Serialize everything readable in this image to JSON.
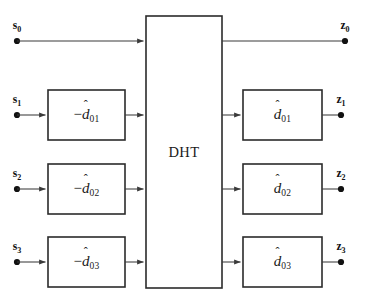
{
  "figure": {
    "background_color": "#ffffff",
    "line_color": "#3a3a3a",
    "box_border_color": "#2b2b2b",
    "text_color": "#1a1a1a",
    "width": 366,
    "height": 307
  },
  "center_block": {
    "label": "DHT",
    "x": 146,
    "y": 16,
    "width": 76,
    "height": 272
  },
  "inputs": [
    {
      "name": "s0",
      "letter": "s",
      "subscript": "0",
      "y": 41
    },
    {
      "name": "s1",
      "letter": "s",
      "subscript": "1",
      "y": 115
    },
    {
      "name": "s2",
      "letter": "s",
      "subscript": "2",
      "y": 189
    },
    {
      "name": "s3",
      "letter": "s",
      "subscript": "3",
      "y": 262
    }
  ],
  "outputs": [
    {
      "name": "z0",
      "letter": "z",
      "subscript": "0",
      "y": 41
    },
    {
      "name": "z1",
      "letter": "z",
      "subscript": "1",
      "y": 115
    },
    {
      "name": "z2",
      "letter": "z",
      "subscript": "2",
      "y": 189
    },
    {
      "name": "z3",
      "letter": "z",
      "subscript": "3",
      "y": 262
    }
  ],
  "left_blocks": [
    {
      "name": "neg-d01",
      "sign": "−",
      "base": "d",
      "hat": "ˆ",
      "subscript": "01",
      "y": 115
    },
    {
      "name": "neg-d02",
      "sign": "−",
      "base": "d",
      "hat": "ˆ",
      "subscript": "02",
      "y": 189
    },
    {
      "name": "neg-d03",
      "sign": "−",
      "base": "d",
      "hat": "ˆ",
      "subscript": "03",
      "y": 262
    }
  ],
  "right_blocks": [
    {
      "name": "d01",
      "sign": "",
      "base": "d",
      "hat": "ˆ",
      "subscript": "01",
      "y": 115
    },
    {
      "name": "d02",
      "sign": "",
      "base": "d",
      "hat": "ˆ",
      "subscript": "02",
      "y": 189
    },
    {
      "name": "d03",
      "sign": "",
      "base": "d",
      "hat": "ˆ",
      "subscript": "03",
      "y": 262
    }
  ],
  "geometry": {
    "left_box_x": 48,
    "left_box_w": 77,
    "right_box_x": 243,
    "right_box_w": 79,
    "box_h": 50,
    "input_dot_x": 17,
    "output_dot_x": 345,
    "output_dot_x_rows": 341
  }
}
